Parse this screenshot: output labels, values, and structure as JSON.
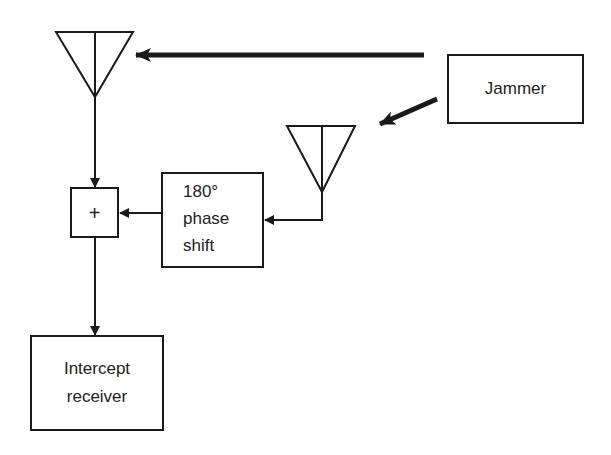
{
  "diagram": {
    "title": "",
    "nodes": {
      "jammer": {
        "label": "Jammer"
      },
      "phase_shift": {
        "line1": "180°",
        "line2": "phase",
        "line3": "shift"
      },
      "summer": {
        "label": "+"
      },
      "receiver": {
        "line1": "Intercept",
        "line2": "receiver"
      },
      "main_antenna": {
        "label": ""
      },
      "auxiliary_antenna": {
        "label": ""
      }
    },
    "edges": [
      {
        "from": "jammer",
        "to": "main_antenna",
        "style": "thick"
      },
      {
        "from": "jammer",
        "to": "auxiliary_antenna",
        "style": "thick"
      },
      {
        "from": "main_antenna",
        "to": "summer"
      },
      {
        "from": "auxiliary_antenna",
        "to": "phase_shift"
      },
      {
        "from": "phase_shift",
        "to": "summer"
      },
      {
        "from": "summer",
        "to": "receiver"
      }
    ],
    "colors": {
      "stroke": "#1a1a1a",
      "background": "#ffffff"
    }
  }
}
